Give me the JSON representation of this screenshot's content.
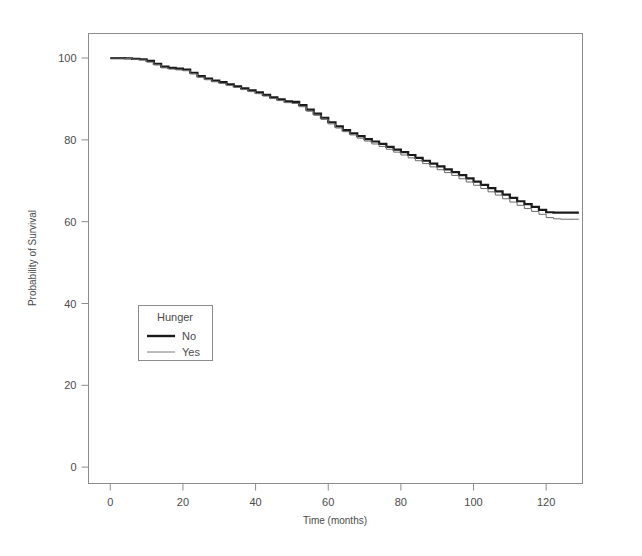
{
  "chart_data": {
    "type": "line",
    "title": "",
    "xlabel": "Time (months)",
    "ylabel": "Probability of Survival",
    "xlim": [
      -6,
      130
    ],
    "ylim": [
      -4,
      106
    ],
    "xticks": [
      0,
      20,
      40,
      60,
      80,
      100,
      120
    ],
    "xtick_labels": [
      "0",
      "20",
      "40",
      "60",
      "80",
      "100",
      "120"
    ],
    "yticks": [
      0,
      20,
      40,
      60,
      80,
      100
    ],
    "ytick_labels": [
      "0",
      "20",
      "40",
      "60",
      "80",
      "100"
    ],
    "grid": false,
    "legend_position": "center-left",
    "legend_title": "Hunger",
    "series": [
      {
        "name": "No",
        "line_style": "thick-solid",
        "color": "#1a1a1a",
        "width": 2.2,
        "x": [
          0,
          2,
          4,
          6,
          8,
          10,
          12,
          14,
          16,
          18,
          20,
          22,
          24,
          26,
          28,
          30,
          32,
          34,
          36,
          38,
          40,
          42,
          44,
          46,
          48,
          50,
          52,
          54,
          56,
          58,
          60,
          62,
          64,
          66,
          68,
          70,
          72,
          74,
          76,
          78,
          80,
          82,
          84,
          86,
          88,
          90,
          92,
          94,
          96,
          98,
          100,
          102,
          104,
          106,
          108,
          110,
          112,
          114,
          116,
          118,
          120,
          122,
          124,
          126,
          128,
          129
        ],
        "values": [
          100.0,
          100.0,
          99.9,
          99.8,
          99.7,
          99.3,
          98.6,
          97.9,
          97.6,
          97.4,
          97.2,
          96.4,
          95.6,
          95.0,
          94.5,
          94.1,
          93.6,
          93.1,
          92.6,
          92.1,
          91.6,
          91.0,
          90.4,
          89.9,
          89.4,
          89.3,
          88.5,
          87.4,
          86.4,
          85.4,
          84.3,
          83.3,
          82.4,
          81.6,
          80.9,
          80.2,
          79.6,
          79.0,
          78.3,
          77.6,
          77.0,
          76.3,
          75.6,
          74.9,
          74.2,
          73.5,
          72.8,
          72.1,
          71.4,
          70.6,
          69.8,
          69.0,
          68.2,
          67.4,
          66.6,
          65.8,
          65.0,
          64.3,
          63.6,
          62.9,
          62.3,
          62.2,
          62.2,
          62.2,
          62.2,
          62.2
        ]
      },
      {
        "name": "Yes",
        "line_style": "thin-solid",
        "color": "#6b6b6b",
        "width": 1.0,
        "x": [
          0,
          2,
          4,
          6,
          8,
          10,
          12,
          14,
          16,
          18,
          20,
          22,
          24,
          26,
          28,
          30,
          32,
          34,
          36,
          38,
          40,
          42,
          44,
          46,
          48,
          50,
          52,
          54,
          56,
          58,
          60,
          62,
          64,
          66,
          68,
          70,
          72,
          74,
          76,
          78,
          80,
          82,
          84,
          86,
          88,
          90,
          92,
          94,
          96,
          98,
          100,
          102,
          104,
          106,
          108,
          110,
          112,
          114,
          116,
          118,
          120,
          122,
          124,
          126,
          128,
          129
        ],
        "values": [
          100.0,
          100.0,
          99.9,
          99.7,
          99.5,
          99.0,
          98.3,
          97.6,
          97.3,
          97.1,
          96.9,
          96.1,
          95.3,
          94.7,
          94.2,
          93.8,
          93.3,
          92.8,
          92.3,
          91.8,
          91.3,
          90.7,
          90.1,
          89.6,
          89.1,
          88.9,
          88.1,
          87.0,
          86.0,
          85.0,
          83.9,
          82.9,
          82.0,
          81.2,
          80.4,
          79.7,
          79.0,
          78.4,
          77.7,
          77.0,
          76.3,
          75.6,
          74.9,
          74.2,
          73.4,
          72.7,
          72.0,
          71.3,
          70.5,
          69.7,
          68.9,
          68.1,
          67.3,
          66.5,
          65.6,
          64.8,
          64.0,
          63.2,
          62.5,
          61.8,
          61.0,
          60.7,
          60.6,
          60.6,
          60.6,
          60.6
        ]
      }
    ]
  },
  "legend": {
    "title": "Hunger",
    "entries": [
      {
        "label": "No"
      },
      {
        "label": "Yes"
      }
    ]
  },
  "axes": {
    "x_title": "Time (months)",
    "y_title": "Probability of Survival"
  },
  "colors": {
    "frame": "#8c8c8c",
    "text": "#4a4a4a",
    "series_no": "#1a1a1a",
    "series_yes": "#6b6b6b",
    "background": "#ffffff"
  }
}
